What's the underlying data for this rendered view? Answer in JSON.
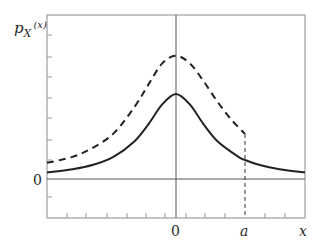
{
  "chart_data": {
    "type": "line",
    "title": "",
    "ylabel": "p_X(x)",
    "ylabel_main": "p",
    "ylabel_sub": "X",
    "ylabel_arg": "(x)",
    "xlabel": "x",
    "x_tick_labels": [
      {
        "value": 0,
        "label": "0"
      },
      {
        "value": 1,
        "label": "a"
      }
    ],
    "y_tick_labels": [
      {
        "value": 0,
        "label": "0"
      }
    ],
    "xlim": [
      -1.87,
      1.87
    ],
    "ylim": [
      -0.46,
      1.93
    ],
    "grid": false,
    "cutoff": {
      "x": 1,
      "label": "a",
      "style": "dashed vertical line"
    },
    "series": [
      {
        "name": "original density",
        "style": "solid",
        "x": [
          -1.87,
          -1.5,
          -1.2,
          -0.9,
          -0.6,
          -0.4,
          -0.2,
          0,
          0.2,
          0.4,
          0.6,
          0.9,
          1.0,
          1.2,
          1.5,
          1.87
        ],
        "y": [
          0.076,
          0.114,
          0.167,
          0.263,
          0.445,
          0.643,
          0.878,
          1.0,
          0.878,
          0.643,
          0.445,
          0.263,
          0.224,
          0.167,
          0.114,
          0.076
        ]
      },
      {
        "name": "truncated density (x < a)",
        "style": "dashed",
        "x": [
          -1.87,
          -1.5,
          -1.2,
          -0.9,
          -0.6,
          -0.4,
          -0.2,
          0,
          0.2,
          0.4,
          0.6,
          0.8,
          1.0
        ],
        "y": [
          0.19,
          0.26,
          0.37,
          0.54,
          0.85,
          1.11,
          1.36,
          1.45,
          1.36,
          1.15,
          0.91,
          0.7,
          0.53
        ]
      }
    ]
  }
}
